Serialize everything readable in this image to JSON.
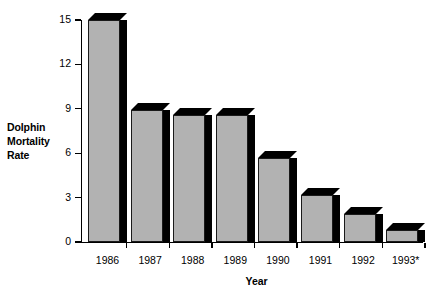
{
  "chart_data": {
    "type": "bar",
    "title": "",
    "subtitle": "",
    "xlabel": "Year",
    "ylabel": "Dolphin Mortality Rate",
    "ylabel_lines": [
      "Dolphin",
      "Mortality",
      "Rate"
    ],
    "categories": [
      "1986",
      "1987",
      "1988",
      "1989",
      "1990",
      "1991",
      "1992",
      "1993*"
    ],
    "values": [
      15.0,
      8.9,
      8.6,
      8.6,
      5.7,
      3.2,
      1.9,
      0.8
    ],
    "ylim": [
      0,
      15
    ],
    "xlim_note": "categorical",
    "yticks": [
      0,
      3,
      6,
      9,
      12,
      15
    ],
    "ytick_labels": [
      "0",
      "3",
      "6",
      "9",
      "12",
      "15"
    ],
    "grid": false,
    "legend": null,
    "legend_position": "none",
    "annotations": [
      "* 1993 value marked with asterisk"
    ],
    "style": {
      "bar_fill": "#b2b2b2",
      "bar_outline": "#1a1a1a",
      "bar_shadow": "#000000",
      "axis_color": "#000000",
      "background": "#ffffff",
      "three_d": true
    }
  }
}
